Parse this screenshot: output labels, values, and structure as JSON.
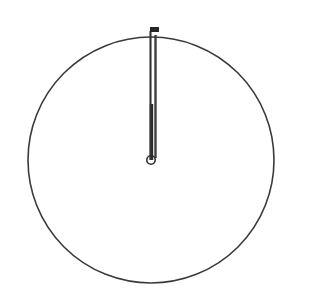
{
  "canvas": {
    "width": 335,
    "height": 307,
    "background_color": "#ffffff",
    "ink_color": "#3a3a3a",
    "ink_color_dark": "#222222"
  },
  "figure": {
    "kind": "analog-clock-face-drawing",
    "time_shown": "12:00"
  },
  "dial": {
    "center_x": 151,
    "center_y": 160,
    "radius": 123,
    "stroke_width": 1.6,
    "stroke_color": "#3a3a3a",
    "fill": "none",
    "label": "clock dial outline"
  },
  "pivot": {
    "center_x": 151,
    "center_y": 160,
    "radius": 4.2,
    "stroke_width": 1.6,
    "stroke_color": "#2e2e2e",
    "fill": "none",
    "label": "center pivot"
  },
  "hands": {
    "minute": {
      "label": "minute hand",
      "angle_degrees": 0,
      "points_to": "12",
      "x": 150.5,
      "y_from": 160,
      "y_to": 31,
      "stroke_width": 2.1,
      "stroke_color": "#333333",
      "length_px": 129
    },
    "hour": {
      "label": "hour hand",
      "angle_degrees": 0,
      "points_to": "12",
      "x": 155.5,
      "y_from": 158,
      "y_to": 35,
      "stroke_width": 2.4,
      "stroke_color": "#3d3d3d",
      "length_px": 123
    },
    "hour_thick_segment": {
      "label": "thickened lower hour hand segment",
      "x": 151.5,
      "y_from": 160,
      "y_to": 104,
      "stroke_width": 3.4,
      "stroke_color": "#2b2b2b"
    }
  },
  "tick_mark_12": {
    "label": "12 o'clock tick mark",
    "x": 150,
    "y": 27,
    "width": 9,
    "height": 5,
    "fill": "#262626"
  },
  "a11y": {
    "figure_caption": "Analog clock showing 12:00"
  }
}
